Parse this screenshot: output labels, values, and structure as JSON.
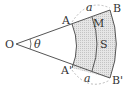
{
  "diagram": {
    "type": "sector-annulus",
    "labels": {
      "O": "O",
      "A": "A",
      "B": "B",
      "A_prime": "A'",
      "B_prime": "B'",
      "M": "M",
      "S": "S",
      "theta": "θ",
      "a_top": "a",
      "a_bottom": "a"
    },
    "colors": {
      "line": "#555555",
      "shade": "#d8d8d8",
      "dashed": "#aaaaaa"
    }
  }
}
